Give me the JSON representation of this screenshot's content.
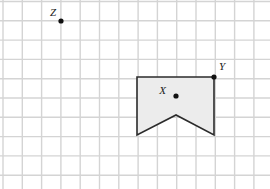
{
  "figure": {
    "canvas": {
      "width": 270,
      "height": 189,
      "background": "#ffffff"
    },
    "grid": {
      "visible": true,
      "cell_size": 19.3,
      "origin_x": 3.0,
      "origin_y": 1.5,
      "columns": 14,
      "rows": 10,
      "line_color": "#d4d4d4",
      "line_width": 1.4
    },
    "shape": {
      "name": "banner-pentagon",
      "kind": "pentagon",
      "fill_color": "#ececec",
      "stroke_color": "#2b2b2b",
      "stroke_width": 1.6,
      "vertices": [
        {
          "name": "top-left",
          "x": 137,
          "y": 77
        },
        {
          "name": "top-right",
          "x": 214,
          "y": 77
        },
        {
          "name": "bottom-right",
          "x": 214,
          "y": 135
        },
        {
          "name": "notch-apex",
          "x": 176,
          "y": 115
        },
        {
          "name": "bottom-left",
          "x": 137,
          "y": 135
        }
      ],
      "path": "M137,77 L214,77 L214,135 L176,115 L137,135 Z"
    },
    "points": [
      {
        "id": "X",
        "label": "X",
        "x": 176,
        "y": 96,
        "radius": 2.6,
        "color": "#111111",
        "label_x": 166,
        "label_y": 94,
        "label_anchor": "end"
      },
      {
        "id": "Y",
        "label": "Y",
        "x": 214,
        "y": 77,
        "radius": 2.6,
        "color": "#111111",
        "label_x": 219,
        "label_y": 70,
        "label_anchor": "start"
      },
      {
        "id": "Z",
        "label": "Z",
        "x": 61,
        "y": 21,
        "radius": 2.6,
        "color": "#111111",
        "label_x": 56,
        "label_y": 16,
        "label_anchor": "end"
      }
    ]
  }
}
